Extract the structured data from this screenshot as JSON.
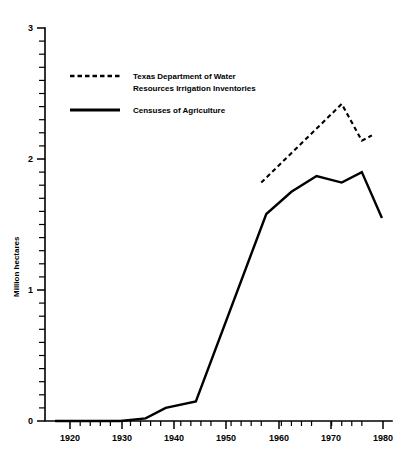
{
  "chart_data": {
    "type": "line",
    "title": "",
    "xlabel": "",
    "ylabel": "Million hectares",
    "xlim": [
      1915,
      1984
    ],
    "ylim": [
      0,
      3
    ],
    "grid": false,
    "legend_position": "upper-left-inside",
    "x_ticks_major": [
      1920,
      1930,
      1940,
      1950,
      1960,
      1970,
      1980
    ],
    "x_tick_labels": [
      "1920",
      "1930",
      "1940",
      "1950",
      "1960",
      "1970",
      "1980"
    ],
    "x_minor_interval": 2,
    "y_ticks_major": [
      0,
      1,
      2,
      3
    ],
    "y_tick_labels": [
      "0",
      "1",
      "2",
      "3"
    ],
    "y_minor_interval": 0.1,
    "series": [
      {
        "name": "Censuses of Agriculture",
        "style": "solid",
        "x": [
          1917,
          1930,
          1935,
          1939,
          1945,
          1959,
          1964,
          1969,
          1974,
          1978,
          1982
        ],
        "values": [
          0.0,
          0.0,
          0.02,
          0.1,
          0.15,
          1.58,
          1.75,
          1.87,
          1.82,
          1.9,
          1.55
        ]
      },
      {
        "name": "Texas Department of Water Resources Irrigation Inventories",
        "style": "dashed",
        "x": [
          1958,
          1974,
          1978,
          1980
        ],
        "values": [
          1.82,
          2.42,
          2.14,
          2.18
        ]
      }
    ]
  },
  "legend": {
    "entries": [
      {
        "style": "dashed",
        "line1": "Texas Department of Water",
        "line2": "Resources  Irrigation Inventories"
      },
      {
        "style": "solid",
        "line1": "Censuses of Agriculture",
        "line2": ""
      }
    ]
  },
  "axes": {
    "y_label": "Million hectares",
    "y_labels": {
      "t0": "0",
      "t1": "1",
      "t2": "2",
      "t3": "3"
    },
    "x_labels": {
      "t1920": "1920",
      "t1930": "1930",
      "t1940": "1940",
      "t1950": "1950",
      "t1960": "1960",
      "t1970": "1970",
      "t1980": "1980"
    }
  },
  "colors": {
    "ink": "#000000",
    "background": "#ffffff"
  }
}
